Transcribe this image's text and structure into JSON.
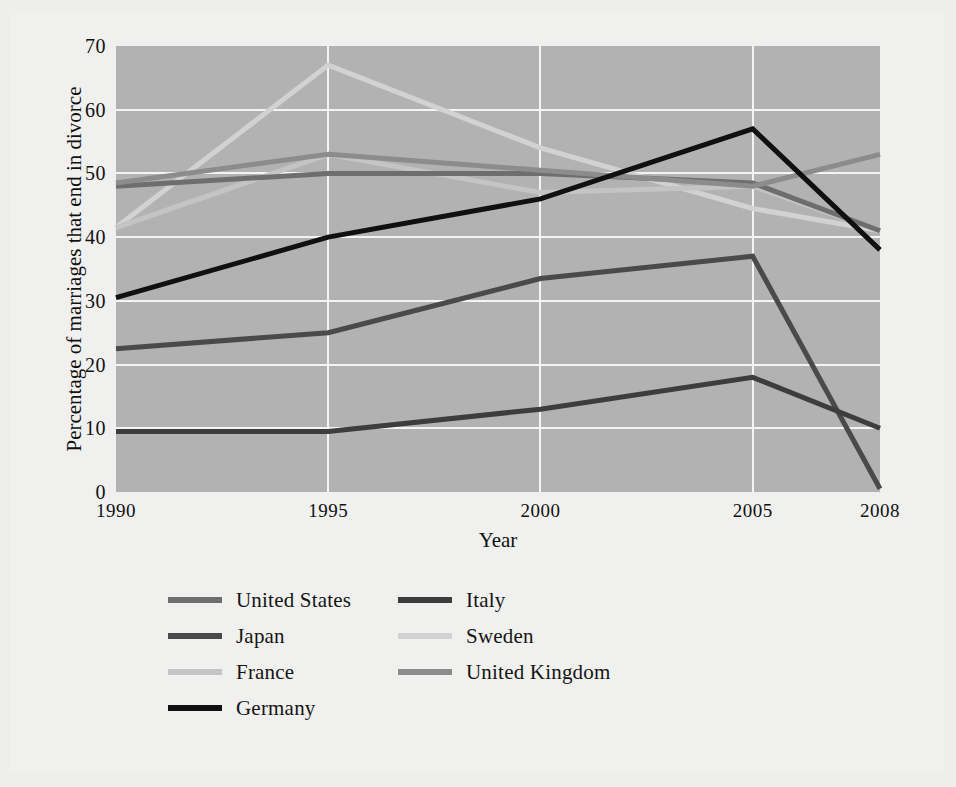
{
  "chart_data": {
    "type": "line",
    "title": "",
    "xlabel": "Year",
    "ylabel": "Percentage of marriages that end in divorce",
    "x": [
      1990,
      1995,
      2000,
      2005,
      2008
    ],
    "xticklabels": [
      "1990",
      "1995",
      "2000",
      "2005",
      "2008"
    ],
    "yticklabels": [
      "0",
      "10",
      "20",
      "30",
      "40",
      "50",
      "60",
      "70"
    ],
    "yticks": [
      0,
      10,
      20,
      30,
      40,
      50,
      60,
      70
    ],
    "ylim": [
      0,
      70
    ],
    "xlim": [
      1990,
      2008
    ],
    "grid": "horizontal-and-vertical",
    "legend_position": "below-axes",
    "plot_background": "#b2b2b2",
    "figure_background": "#f0f0ee",
    "gridline_color": "#f4f4f2",
    "series": [
      {
        "name": "United States",
        "color": "#6e6e6e",
        "values": [
          48.0,
          50.0,
          50.0,
          48.5,
          41.0
        ]
      },
      {
        "name": "Japan",
        "color": "#4a4a4a",
        "values": [
          22.5,
          25.0,
          33.5,
          37.0,
          0.5
        ]
      },
      {
        "name": "France",
        "color": "#c4c4c4",
        "values": [
          41.5,
          53.0,
          47.0,
          48.0,
          41.0
        ]
      },
      {
        "name": "Germany",
        "color": "#101010",
        "values": [
          30.5,
          40.0,
          46.0,
          57.0,
          38.0
        ]
      },
      {
        "name": "Italy",
        "color": "#3d3d3d",
        "values": [
          9.5,
          9.5,
          13.0,
          18.0,
          10.0
        ]
      },
      {
        "name": "Sweden",
        "color": "#d2d2d2",
        "values": [
          41.5,
          67.0,
          54.0,
          44.5,
          41.0
        ]
      },
      {
        "name": "United Kingdom",
        "color": "#8c8c8c",
        "values": [
          48.5,
          53.0,
          50.5,
          48.0,
          53.0
        ]
      }
    ]
  },
  "legend": {
    "entries": [
      {
        "label": "United States",
        "color": "#6e6e6e"
      },
      {
        "label": "Italy",
        "color": "#3d3d3d"
      },
      {
        "label": "Japan",
        "color": "#4a4a4a"
      },
      {
        "label": "Sweden",
        "color": "#d2d2d2"
      },
      {
        "label": "France",
        "color": "#c4c4c4"
      },
      {
        "label": "United Kingdom",
        "color": "#8c8c8c"
      },
      {
        "label": "Germany",
        "color": "#101010"
      }
    ]
  }
}
